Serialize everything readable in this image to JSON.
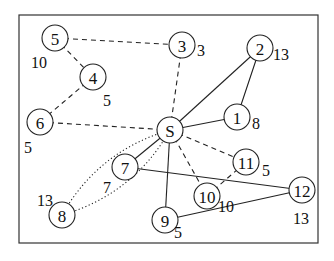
{
  "diagram": {
    "type": "graph",
    "frame": {
      "x": 19,
      "y": 15,
      "width": 299,
      "height": 228
    },
    "nodes": [
      {
        "id": "S",
        "label": "S",
        "x": 170,
        "y": 130,
        "weight": null
      },
      {
        "id": "1",
        "label": "1",
        "x": 237,
        "y": 117,
        "weight": "8",
        "wx": 252,
        "wy": 123
      },
      {
        "id": "2",
        "label": "2",
        "x": 260,
        "y": 48,
        "weight": "13",
        "wx": 273,
        "wy": 54
      },
      {
        "id": "3",
        "label": "3",
        "x": 182,
        "y": 45,
        "weight": "3",
        "wx": 197,
        "wy": 50
      },
      {
        "id": "4",
        "label": "4",
        "x": 93,
        "y": 77,
        "weight": "5",
        "wx": 103,
        "wy": 100
      },
      {
        "id": "5",
        "label": "5",
        "x": 55,
        "y": 38,
        "weight": "10",
        "wx": 31,
        "wy": 62
      },
      {
        "id": "6",
        "label": "6",
        "x": 40,
        "y": 122,
        "weight": "5",
        "wx": 24,
        "wy": 147
      },
      {
        "id": "7",
        "label": "7",
        "x": 125,
        "y": 167,
        "weight": "7",
        "wx": 103,
        "wy": 187
      },
      {
        "id": "8",
        "label": "8",
        "x": 62,
        "y": 215,
        "weight": "13",
        "wx": 37,
        "wy": 200
      },
      {
        "id": "9",
        "label": "9",
        "x": 165,
        "y": 220,
        "weight": "5",
        "wx": 174,
        "wy": 232
      },
      {
        "id": "10",
        "label": "10",
        "x": 207,
        "y": 196,
        "weight": "10",
        "wx": 218,
        "wy": 206
      },
      {
        "id": "11",
        "label": "11",
        "x": 246,
        "y": 162,
        "weight": "5",
        "wx": 262,
        "wy": 170
      },
      {
        "id": "12",
        "label": "12",
        "x": 302,
        "y": 190,
        "weight": "13",
        "wx": 293,
        "wy": 218
      }
    ],
    "edges": [
      {
        "from": "S",
        "to": "1",
        "style": "solid"
      },
      {
        "from": "S",
        "to": "2",
        "style": "solid"
      },
      {
        "from": "1",
        "to": "2",
        "style": "solid"
      },
      {
        "from": "S",
        "to": "7",
        "style": "solid"
      },
      {
        "from": "S",
        "to": "9",
        "style": "solid"
      },
      {
        "from": "7",
        "to": "12",
        "style": "solid"
      },
      {
        "from": "9",
        "to": "12",
        "style": "solid"
      },
      {
        "from": "S",
        "to": "3",
        "style": "dashed"
      },
      {
        "from": "5",
        "to": "3",
        "style": "dashed"
      },
      {
        "from": "5",
        "to": "4",
        "style": "dashed"
      },
      {
        "from": "4",
        "to": "6",
        "style": "dashed"
      },
      {
        "from": "6",
        "to": "S",
        "style": "dashed"
      },
      {
        "from": "S",
        "to": "11",
        "style": "dashed"
      },
      {
        "from": "S",
        "to": "10",
        "style": "dashed"
      },
      {
        "from": "10",
        "to": "11",
        "style": "dashed"
      },
      {
        "from": "S",
        "to": "8",
        "style": "dotted",
        "curve": "upper"
      },
      {
        "from": "S",
        "to": "8",
        "style": "dotted",
        "curve": "lower"
      }
    ],
    "node_radius": 13
  }
}
